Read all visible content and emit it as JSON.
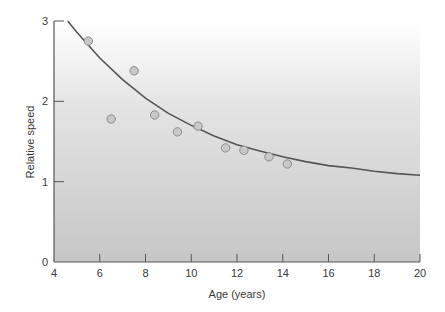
{
  "chart_data": {
    "type": "scatter",
    "title": "",
    "xlabel": "Age (years)",
    "ylabel": "Relative speed",
    "xlim": [
      4,
      20
    ],
    "ylim": [
      0,
      3
    ],
    "x_ticks": [
      4,
      6,
      8,
      10,
      12,
      14,
      16,
      18,
      20
    ],
    "y_ticks": [
      0,
      1,
      2,
      3
    ],
    "grid": false,
    "legend": null,
    "background": "vertical gradient white (top) to gray (bottom)",
    "series": [
      {
        "name": "observations",
        "kind": "scatter",
        "x": [
          5.5,
          6.5,
          7.5,
          8.4,
          9.4,
          10.3,
          11.5,
          12.3,
          13.4,
          14.2
        ],
        "y": [
          2.75,
          1.78,
          2.38,
          1.83,
          1.62,
          1.69,
          1.42,
          1.39,
          1.31,
          1.22
        ]
      },
      {
        "name": "fitted curve",
        "kind": "line",
        "x": [
          4.6,
          5,
          6,
          7,
          8,
          9,
          10,
          11,
          12,
          13,
          14,
          15,
          16,
          17,
          18,
          19,
          20
        ],
        "y": [
          3.0,
          2.86,
          2.54,
          2.27,
          2.04,
          1.85,
          1.7,
          1.57,
          1.46,
          1.38,
          1.31,
          1.25,
          1.2,
          1.17,
          1.13,
          1.1,
          1.08
        ]
      }
    ]
  },
  "colors": {
    "axis": "#555555",
    "curve": "#555555",
    "point_fill": "#c8c8c8",
    "point_stroke": "#8a8a8a",
    "bg_top": "#ffffff",
    "bg_bottom": "#c9c9c9"
  }
}
